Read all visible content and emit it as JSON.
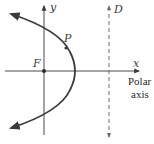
{
  "diagram": {
    "type": "conic-parabola-polar",
    "labels": {
      "y_axis": "y",
      "x_axis": "x",
      "focus": "F",
      "point": "P",
      "directrix": "D",
      "polar_axis_line1": "Polar",
      "polar_axis_line2": "axis"
    },
    "colors": {
      "curve": "#3a3a3a",
      "axes": "#4a4a4a",
      "directrix": "#6a6a6a",
      "text": "#2a2a2a"
    },
    "elements": [
      {
        "name": "y-axis",
        "kind": "arrow-line",
        "direction": "up"
      },
      {
        "name": "x-axis",
        "kind": "arrow-line",
        "direction": "right"
      },
      {
        "name": "parabola",
        "kind": "curve",
        "opens": "left",
        "arrows": "both-ends"
      },
      {
        "name": "focus",
        "kind": "point",
        "at": "origin"
      },
      {
        "name": "point-p",
        "kind": "point",
        "on": "parabola"
      },
      {
        "name": "directrix",
        "kind": "dashed-line",
        "arrows": "both-ends",
        "position": "vertical, right of vertex"
      }
    ]
  }
}
